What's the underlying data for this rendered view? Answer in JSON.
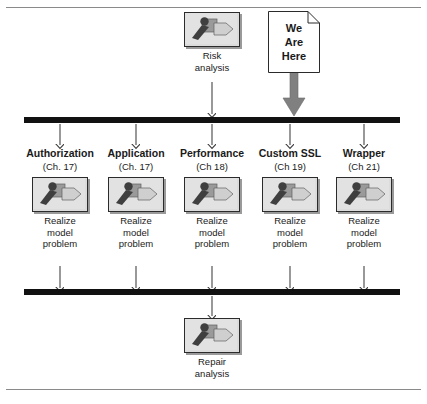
{
  "diagram": {
    "colors": {
      "bar": "#111111",
      "arrow": "#3c3c3c",
      "fat_arrow": "#808080",
      "tile_face": "#dcdcdc",
      "tile_border": "#2b2b2b",
      "tile_shadow": "#9a9a9a",
      "icon_dark": "#3f3f3f",
      "icon_mid": "#9a9a9a",
      "icon_light": "#cfcfcf",
      "page_rule": "#8a8a8a",
      "note_fill": "#ffffff",
      "note_border": "#2b2b2b",
      "text": "#1a1a1a"
    },
    "icon_name": "use-case-realization-icon",
    "top_node": {
      "icon": "use-case-realization-icon",
      "caption_lines": [
        "Risk",
        "analysis"
      ]
    },
    "note": {
      "lines": [
        "We",
        "Are",
        "Here"
      ],
      "pointer": "fat-down-arrow"
    },
    "columns": [
      {
        "title": "Authorization",
        "chapter": "(Ch. 17)",
        "icon": "use-case-realization-icon",
        "caption_lines": [
          "Realize",
          "model",
          "problem"
        ]
      },
      {
        "title": "Application",
        "chapter": "(Ch. 17)",
        "icon": "use-case-realization-icon",
        "caption_lines": [
          "Realize",
          "model",
          "problem"
        ]
      },
      {
        "title": "Performance",
        "chapter": "(Ch 18)",
        "icon": "use-case-realization-icon",
        "caption_lines": [
          "Realize",
          "model",
          "problem"
        ]
      },
      {
        "title": "Custom SSL",
        "chapter": "(Ch 19)",
        "icon": "use-case-realization-icon",
        "caption_lines": [
          "Realize",
          "model",
          "problem"
        ]
      },
      {
        "title": "Wrapper",
        "chapter": "(Ch 21)",
        "icon": "use-case-realization-icon",
        "caption_lines": [
          "Realize",
          "model",
          "problem"
        ]
      }
    ],
    "bottom_node": {
      "icon": "use-case-realization-icon",
      "caption_lines": [
        "Repair",
        "analysis"
      ]
    },
    "bars": [
      {
        "name": "upper-sync-bar"
      },
      {
        "name": "lower-sync-bar"
      }
    ]
  }
}
